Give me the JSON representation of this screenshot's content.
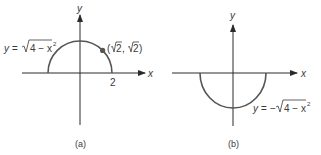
{
  "panels": [
    {
      "id": "a",
      "caption": "(a)",
      "x_axis_label": "x",
      "y_axis_label": "y",
      "tick_label": "2",
      "curve": "upper semicircle",
      "equation": {
        "lhs": "y = ",
        "radicand": "4 − x",
        "exp": "2"
      },
      "point_label": {
        "open": "(",
        "r1": "2",
        "sep": ", ",
        "r2": "2",
        "close": ")"
      },
      "point": {
        "x": "√2",
        "y": "√2"
      },
      "radius": 2
    },
    {
      "id": "b",
      "caption": "(b)",
      "x_axis_label": "x",
      "y_axis_label": "y",
      "curve": "lower semicircle",
      "equation": {
        "lhs": "y = −",
        "radicand": "4 − x",
        "exp": "2"
      },
      "radius": 2
    }
  ],
  "colors": {
    "axis": "#2a2a2a",
    "curve": "#555555",
    "point": "#555555",
    "text": "#3a3a3a"
  }
}
